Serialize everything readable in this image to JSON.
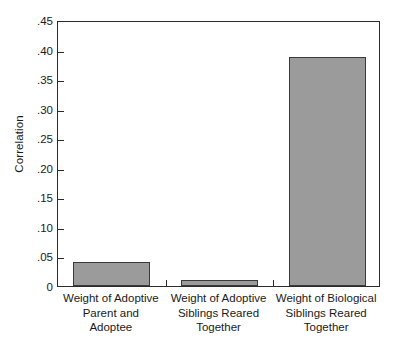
{
  "chart_data": {
    "type": "bar",
    "title": "",
    "subtitle": "",
    "xlabel": "",
    "ylabel": "Correlation",
    "ylim": [
      0,
      0.45
    ],
    "ytick_step": 0.05,
    "grid": false,
    "legend": "none",
    "bar_fill_color": "#9b9b9b",
    "bar_edge_color": "#3a3a3a",
    "axis_color": "#2b2b2b",
    "background_color": "#ffffff",
    "categories": [
      "Weight of Adoptive Parent and Adoptee",
      "Weight of Adoptive Siblings Reared Together",
      "Weight of Biological Siblings Reared Together"
    ],
    "values": [
      0.04,
      0.01,
      0.387
    ],
    "ytick_labels": [
      ".45",
      ".40",
      ".35",
      ".30",
      ".25",
      ".20",
      ".15",
      ".10",
      ".05",
      "0"
    ],
    "ytick_values": [
      0.45,
      0.4,
      0.35,
      0.3,
      0.25,
      0.2,
      0.15,
      0.1,
      0.05,
      0
    ]
  },
  "axis": {
    "y_title": "Correlation"
  },
  "x_categories": [
    {
      "lines": [
        "Weight of Adoptive",
        "Parent and",
        "Adoptee"
      ]
    },
    {
      "lines": [
        "Weight of Adoptive",
        "Siblings Reared",
        "Together"
      ]
    },
    {
      "lines": [
        "Weight of Biological",
        "Siblings Reared",
        "Together"
      ]
    }
  ]
}
